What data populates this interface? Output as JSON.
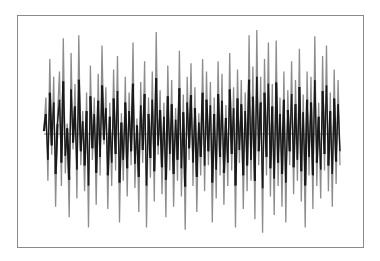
{
  "chart_data": {
    "type": "line",
    "title": "",
    "xlabel": "",
    "ylabel": "",
    "grid": false,
    "legend": null,
    "zero_line": true,
    "ylim": [
      -1,
      1
    ],
    "x_start": 0,
    "series": [
      {
        "name": "signal",
        "color": "#888888",
        "values": [
          0.05,
          0.35,
          -0.45,
          0.72,
          -0.2,
          0.55,
          -0.7,
          0.18,
          0.6,
          -0.5,
          0.92,
          -0.38,
          0.1,
          -0.8,
          0.78,
          -0.15,
          0.48,
          -0.62,
          0.95,
          -0.3,
          0.22,
          -0.55,
          0.4,
          -0.9,
          0.66,
          -0.25,
          0.35,
          -0.68,
          0.58,
          -0.4,
          0.85,
          -0.1,
          0.45,
          -0.72,
          0.3,
          -0.5,
          0.62,
          -0.35,
          0.75,
          -0.85,
          0.2,
          -0.45,
          0.55,
          -0.6,
          0.4,
          -0.3,
          0.88,
          -0.52,
          0.15,
          -0.75,
          0.5,
          -0.28,
          0.7,
          -0.9,
          0.35,
          -0.42,
          0.6,
          -0.65,
          0.98,
          -0.2,
          0.42,
          -0.58,
          0.3,
          -0.8,
          0.66,
          -0.35,
          0.52,
          -0.7,
          0.25,
          -0.45,
          0.8,
          -0.6,
          0.38,
          -0.92,
          0.55,
          -0.25,
          0.68,
          -0.5,
          0.45,
          -0.75,
          0.2,
          -0.4,
          0.72,
          -0.55,
          0.6,
          -0.3,
          0.5,
          -0.85,
          0.35,
          -0.62,
          0.7,
          -0.4,
          0.58,
          -0.68,
          0.28,
          -0.5,
          0.78,
          -0.35,
          0.45,
          -0.9,
          0.62,
          -0.28,
          0.52,
          -0.72,
          0.4,
          -0.55,
          0.95,
          -0.45,
          0.65,
          -0.82,
          1.0,
          -0.3,
          0.55,
          -0.95,
          0.72,
          -0.4,
          0.88,
          -0.6,
          0.48,
          -0.78,
          0.9,
          -0.5,
          0.35,
          -0.7,
          0.6,
          -0.85,
          0.42,
          -0.3,
          0.7,
          -0.58,
          0.52,
          -0.45,
          0.82,
          -0.65,
          0.38,
          -0.9,
          0.6,
          -0.4,
          0.55,
          -0.72,
          0.94,
          -0.5,
          0.3,
          -0.62,
          0.75,
          -0.35,
          0.85,
          -0.55,
          0.4,
          -0.7,
          0.62,
          -0.48,
          0.52,
          -0.3
        ]
      }
    ]
  },
  "plot": {
    "frame_color": "#8a8a8a",
    "light_line_color": "#8c8c8c",
    "dark_line_color": "#1a1a1a",
    "zero_line_color": "#555555"
  }
}
